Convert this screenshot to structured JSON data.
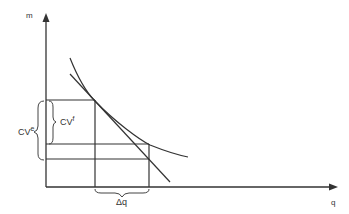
{
  "diagram": {
    "axes": {
      "y_label": "m",
      "x_label": "q"
    },
    "labels": {
      "cv_e": "CV",
      "cv_e_sup": "e",
      "cv_f": "CV",
      "cv_f_sup": "f",
      "delta_q": "Δq"
    },
    "colors": {
      "line": "#333333",
      "background": "#ffffff"
    }
  }
}
